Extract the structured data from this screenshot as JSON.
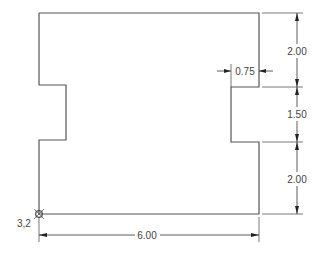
{
  "drawing": {
    "type": "cad-profile",
    "colors": {
      "outline": "#555555",
      "dimension": "#333333",
      "text": "#444444",
      "background": "#ffffff"
    },
    "origin_label": "3,2",
    "dimensions": {
      "top_right_height": "2.00",
      "notch_height": "1.50",
      "bottom_right_height": "2.00",
      "notch_depth": "0.75",
      "overall_width": "6.00"
    }
  }
}
